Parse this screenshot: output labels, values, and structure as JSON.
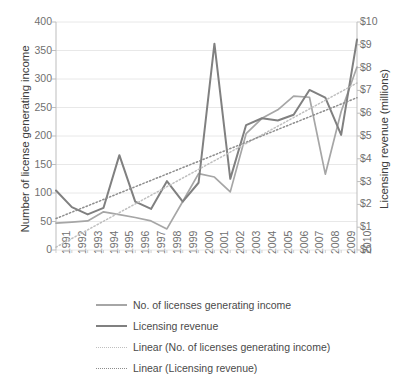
{
  "chart_data": {
    "type": "line",
    "title": "",
    "xlabel": "",
    "ylabel": "Number of license generating income",
    "ylabel_secondary": "Licensing revenue (millions)",
    "categories": [
      "1991",
      "1992",
      "1993",
      "1994",
      "1995",
      "1996",
      "1997",
      "1998",
      "1999",
      "2000",
      "2001",
      "2002",
      "2003",
      "2004",
      "2005",
      "2006",
      "2007",
      "2008",
      "2009",
      "2010"
    ],
    "ylim": [
      0,
      400
    ],
    "yticks": [
      "0",
      "50",
      "100",
      "150",
      "200",
      "250",
      "300",
      "350",
      "400"
    ],
    "ylim_secondary": [
      0,
      10
    ],
    "yticks_secondary": [
      "$0",
      "$1",
      "$2",
      "$3",
      "$4",
      "$5",
      "$6",
      "$7",
      "$8",
      "$9",
      "$10"
    ],
    "grid": true,
    "legend_position": "bottom-left",
    "series": [
      {
        "name": "No. of licenses generating income",
        "axis": "left",
        "color": "#a6a6a6",
        "style": "solid",
        "values": [
          47,
          49,
          51,
          67,
          62,
          57,
          51,
          37,
          85,
          134,
          128,
          102,
          204,
          231,
          246,
          270,
          268,
          133,
          243,
          321
        ]
      },
      {
        "name": "Licensing revenue",
        "axis": "right",
        "color": "#808080",
        "style": "solid",
        "values": [
          2.61,
          1.88,
          1.56,
          1.85,
          4.16,
          2.12,
          1.8,
          3.02,
          2.12,
          2.95,
          9.05,
          3.12,
          5.48,
          5.78,
          5.68,
          5.93,
          7.02,
          6.68,
          5.05,
          9.23
        ]
      },
      {
        "name": "Linear (No. of licenses generating income)",
        "axis": "left",
        "color": "#bfbfbf",
        "style": "dotted",
        "trend_endpoints": [
          5,
          293
        ]
      },
      {
        "name": "Linear (Licensing revenue)",
        "axis": "right",
        "color": "#8c8c8c",
        "style": "dotted",
        "trend_endpoints": [
          1.38,
          6.68
        ]
      }
    ],
    "legend": [
      {
        "label": "No. of licenses generating income",
        "color": "#a6a6a6",
        "style": "solid",
        "width": 2.0
      },
      {
        "label": "Licensing revenue",
        "color": "#808080",
        "style": "solid",
        "width": 2.6
      },
      {
        "label": "Linear (No. of licenses generating income)",
        "color": "#bfbfbf",
        "style": "dotted",
        "width": 1.4
      },
      {
        "label": "Linear (Licensing revenue)",
        "color": "#8c8c8c",
        "style": "dotted",
        "width": 1.4
      }
    ]
  }
}
